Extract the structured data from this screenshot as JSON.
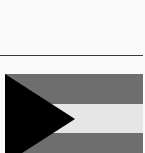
{
  "image": {
    "subject": "flag",
    "stripe_colors": [
      "#6e6e6e",
      "#e6e6e6",
      "#6e6e6e"
    ],
    "triangle_color": "#000000",
    "divider_color": "#3a3a3a",
    "background": "#fafafa"
  }
}
